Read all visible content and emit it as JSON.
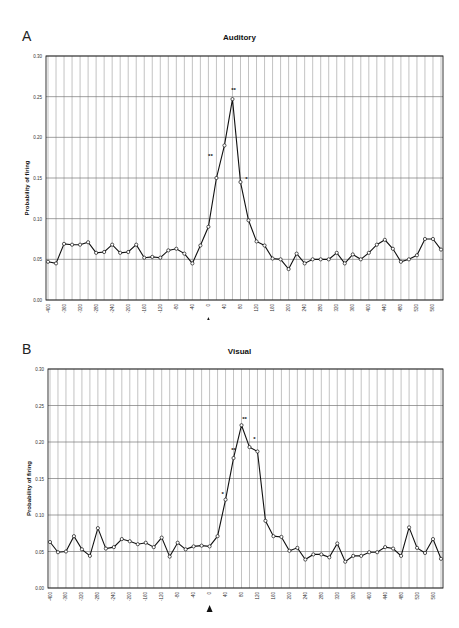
{
  "chart_data": [
    {
      "type": "line",
      "panel": "A",
      "title": "Auditory",
      "xlabel": "milliseconds",
      "ylabel": "Probability of firing",
      "ylim": [
        0,
        0.3
      ],
      "yticks": [
        "0.00",
        "0.05",
        "0.10",
        "0.15",
        "0.20",
        "0.25",
        "0.30"
      ],
      "xticks": [
        "-400",
        "-360",
        "-320",
        "-280",
        "-240",
        "-200",
        "-160",
        "-120",
        "-80",
        "-40",
        "0",
        "40",
        "80",
        "120",
        "160",
        "200",
        "240",
        "280",
        "320",
        "360",
        "400",
        "440",
        "480",
        "520",
        "560"
      ],
      "grid": true,
      "stimulus_marker": "arrow at 0",
      "x": [
        -400,
        -380,
        -360,
        -340,
        -320,
        -300,
        -280,
        -260,
        -240,
        -220,
        -200,
        -180,
        -160,
        -140,
        -120,
        -100,
        -80,
        -60,
        -40,
        -20,
        0,
        20,
        40,
        60,
        80,
        100,
        120,
        140,
        160,
        180,
        200,
        220,
        240,
        260,
        280,
        300,
        320,
        340,
        360,
        380,
        400,
        420,
        440,
        460,
        480,
        500,
        520,
        540,
        560,
        580
      ],
      "values": [
        0.047,
        0.045,
        0.069,
        0.068,
        0.068,
        0.071,
        0.058,
        0.059,
        0.068,
        0.058,
        0.059,
        0.068,
        0.052,
        0.053,
        0.052,
        0.061,
        0.063,
        0.057,
        0.045,
        0.067,
        0.09,
        0.15,
        0.19,
        0.247,
        0.145,
        0.098,
        0.072,
        0.067,
        0.051,
        0.05,
        0.038,
        0.057,
        0.045,
        0.05,
        0.05,
        0.05,
        0.058,
        0.045,
        0.056,
        0.05,
        0.058,
        0.068,
        0.074,
        0.063,
        0.047,
        0.05,
        0.055,
        0.075,
        0.075,
        0.062
      ],
      "annotations": [
        {
          "x": 20,
          "label": "**"
        },
        {
          "x": 60,
          "label": "**"
        },
        {
          "x": 80,
          "label": "*"
        }
      ]
    },
    {
      "type": "line",
      "panel": "B",
      "title": "Visual",
      "xlabel": "",
      "ylabel": "Probability of firing",
      "ylim": [
        0,
        0.3
      ],
      "yticks": [
        "0.00",
        "0.05",
        "0.10",
        "0.15",
        "0.20",
        "0.25",
        "0.30"
      ],
      "xticks": [
        "-400",
        "-360",
        "-320",
        "-280",
        "-240",
        "-200",
        "-160",
        "-120",
        "-80",
        "-40",
        "0",
        "40",
        "80",
        "120",
        "160",
        "200",
        "240",
        "280",
        "320",
        "360",
        "400",
        "440",
        "480",
        "520",
        "560"
      ],
      "grid": true,
      "stimulus_marker": "arrow at 0",
      "x": [
        -400,
        -380,
        -360,
        -340,
        -320,
        -300,
        -280,
        -260,
        -240,
        -220,
        -200,
        -180,
        -160,
        -140,
        -120,
        -100,
        -80,
        -60,
        -40,
        -20,
        0,
        20,
        40,
        60,
        80,
        100,
        120,
        140,
        160,
        180,
        200,
        220,
        240,
        260,
        280,
        300,
        320,
        340,
        360,
        380,
        400,
        420,
        440,
        460,
        480,
        500,
        520,
        540,
        560,
        580
      ],
      "values": [
        0.063,
        0.049,
        0.05,
        0.071,
        0.053,
        0.044,
        0.082,
        0.054,
        0.056,
        0.067,
        0.064,
        0.06,
        0.062,
        0.056,
        0.069,
        0.043,
        0.062,
        0.053,
        0.057,
        0.058,
        0.057,
        0.071,
        0.121,
        0.178,
        0.223,
        0.193,
        0.187,
        0.092,
        0.071,
        0.07,
        0.051,
        0.055,
        0.039,
        0.046,
        0.046,
        0.042,
        0.061,
        0.036,
        0.044,
        0.044,
        0.049,
        0.049,
        0.056,
        0.054,
        0.044,
        0.083,
        0.055,
        0.048,
        0.067,
        0.04
      ],
      "annotations": [
        {
          "x": 40,
          "label": "*"
        },
        {
          "x": 60,
          "label": "**"
        },
        {
          "x": 80,
          "label": "**"
        },
        {
          "x": 100,
          "label": "*"
        }
      ]
    }
  ],
  "panels": {
    "a": {
      "letter": "A",
      "title": "Auditory",
      "ylabel": "Probability of firing",
      "xlabel": "milliseconds"
    },
    "b": {
      "letter": "B",
      "title": "Visual",
      "ylabel": "Probability of firing"
    }
  }
}
